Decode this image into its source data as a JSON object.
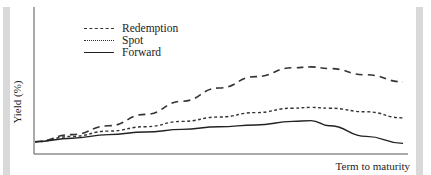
{
  "chart_data": {
    "type": "line",
    "title": "",
    "xlabel": "Term to maturity",
    "ylabel": "Yield (%)",
    "grid": false,
    "legend_position": "upper-left",
    "x_ticks": [],
    "y_ticks": [],
    "x": [
      0,
      0.1,
      0.2,
      0.3,
      0.4,
      0.5,
      0.6,
      0.7,
      0.75,
      0.8,
      0.9,
      1.0
    ],
    "series": [
      {
        "name": "Redemption",
        "style": "dashed",
        "values": [
          0.14,
          0.22,
          0.32,
          0.45,
          0.6,
          0.75,
          0.88,
          0.98,
          0.99,
          0.97,
          0.9,
          0.82
        ]
      },
      {
        "name": "Spot",
        "style": "dotted",
        "values": [
          0.14,
          0.2,
          0.26,
          0.31,
          0.37,
          0.42,
          0.47,
          0.52,
          0.53,
          0.52,
          0.48,
          0.41
        ]
      },
      {
        "name": "Forward",
        "style": "solid",
        "values": [
          0.14,
          0.18,
          0.22,
          0.25,
          0.28,
          0.31,
          0.33,
          0.37,
          0.38,
          0.32,
          0.2,
          0.12
        ]
      }
    ]
  },
  "legend": {
    "items": [
      {
        "label": "Redemption",
        "style": "dashed"
      },
      {
        "label": "Spot",
        "style": "dotted"
      },
      {
        "label": "Forward",
        "style": "solid"
      }
    ]
  },
  "axes": {
    "xlabel": "Term to maturity",
    "ylabel": "Yield (%)"
  }
}
